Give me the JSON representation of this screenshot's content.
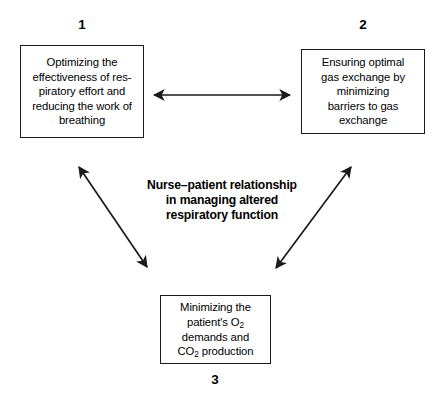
{
  "diagram": {
    "type": "triangular-relationship-diagram",
    "background_color": "#ffffff",
    "line_color": "#1a1a1a",
    "text_color": "#000000",
    "center_caption": {
      "line1": "Nurse–patient relationship",
      "line2": "in managing altered",
      "line3": "respiratory function"
    },
    "nodes": [
      {
        "number": "1",
        "number_position": "above",
        "lines": [
          "Optimizing the",
          "effectiveness of res-",
          "piratory effort and",
          "reducing the work of",
          "breathing"
        ]
      },
      {
        "number": "2",
        "number_position": "above",
        "lines": [
          "Ensuring optimal",
          "gas exchange by",
          "minimizing",
          "barriers to gas",
          "exchange"
        ]
      },
      {
        "number": "3",
        "number_position": "below",
        "lines_html": [
          "Minimizing the",
          "patient's O<sub>2</sub>",
          "demands and",
          "CO<sub>2</sub> production"
        ]
      }
    ],
    "connectors": [
      {
        "name": "arrow-box1-box2",
        "style": "double-headed",
        "orientation": "horizontal",
        "from": "1",
        "to": "2"
      },
      {
        "name": "arrow-box1-box3",
        "style": "double-headed",
        "orientation": "diagonal-down-right",
        "from": "1",
        "to": "3"
      },
      {
        "name": "arrow-box2-box3",
        "style": "double-headed",
        "orientation": "diagonal-down-left",
        "from": "2",
        "to": "3"
      }
    ]
  }
}
